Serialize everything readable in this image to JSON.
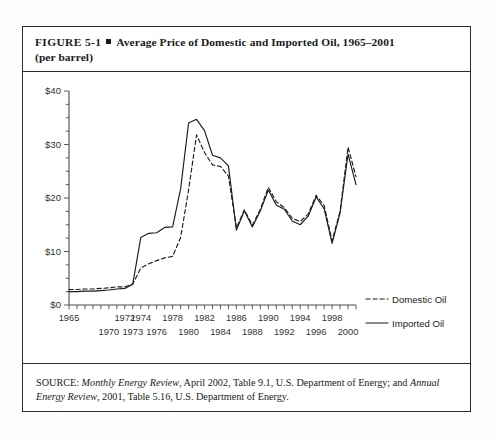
{
  "figure": {
    "number": "FIGURE  5-1",
    "bullet": "square-bullet",
    "title_line1": "Average Price of Domestic and Imported Oil, 1965–2001",
    "title_line2": "(per barrel)"
  },
  "source": {
    "label": "SOURCE:",
    "part1_italic": "Monthly Energy Review",
    "part2": ", April 2002, Table 9.1, U.S. Department of Energy; and ",
    "part3_italic": "Annual Energy Review",
    "part4": ", 2001, Table 5.16, U.S. Department of Energy."
  },
  "legend": {
    "domestic_label": "Domestic Oil",
    "imported_label": "Imported Oil"
  },
  "chart_data": {
    "type": "line",
    "title": "Average Price of Domestic and Imported Oil, 1965–2001 (per barrel)",
    "xlabel": "",
    "ylabel": "",
    "xlim": [
      1965,
      2001
    ],
    "ylim": [
      0,
      40
    ],
    "grid": false,
    "legend_position": "bottom-right",
    "y_tick_labels": [
      "$0",
      "$10",
      "$20",
      "$30",
      "$40"
    ],
    "y_tick_values": [
      0,
      10,
      20,
      30,
      40
    ],
    "y_minor_tick_step": 2.5,
    "x_tick_labels_upper": [
      "1965",
      "1972",
      "1974",
      "1978",
      "1982",
      "1986",
      "1990",
      "1994",
      "1998"
    ],
    "x_tick_values_upper": [
      1965,
      1972,
      1974,
      1978,
      1982,
      1986,
      1990,
      1994,
      1998
    ],
    "x_tick_labels_lower": [
      "1970",
      "1973",
      "1976",
      "1980",
      "1984",
      "1988",
      "1992",
      "1996",
      "2000"
    ],
    "x_tick_values_lower": [
      1970,
      1973,
      1976,
      1980,
      1984,
      1988,
      1992,
      1996,
      2000
    ],
    "x_minor_tick_step": 1,
    "x": [
      1965,
      1966,
      1967,
      1968,
      1969,
      1970,
      1971,
      1972,
      1973,
      1974,
      1975,
      1976,
      1977,
      1978,
      1979,
      1980,
      1981,
      1982,
      1983,
      1984,
      1985,
      1986,
      1987,
      1988,
      1989,
      1990,
      1991,
      1992,
      1993,
      1994,
      1995,
      1996,
      1997,
      1998,
      1999,
      2000,
      2001
    ],
    "series": [
      {
        "name": "Domestic Oil",
        "style": "dashed",
        "values": [
          2.9,
          2.9,
          3.0,
          3.0,
          3.1,
          3.2,
          3.4,
          3.4,
          3.9,
          6.9,
          7.7,
          8.3,
          8.8,
          9.1,
          12.6,
          21.5,
          31.8,
          28.5,
          26.2,
          25.9,
          24.1,
          14.4,
          17.8,
          14.9,
          17.9,
          22.0,
          19.3,
          18.2,
          16.2,
          15.6,
          17.0,
          20.5,
          18.6,
          12.0,
          17.5,
          29.5,
          24.0
        ]
      },
      {
        "name": "Imported Oil",
        "style": "solid",
        "values": [
          2.5,
          2.5,
          2.6,
          2.6,
          2.7,
          2.8,
          3.0,
          3.1,
          3.9,
          12.6,
          13.4,
          13.5,
          14.5,
          14.6,
          21.7,
          34.0,
          34.7,
          32.6,
          28.0,
          27.5,
          26.0,
          14.0,
          17.6,
          14.6,
          17.6,
          21.5,
          18.7,
          17.9,
          15.7,
          15.0,
          16.6,
          20.2,
          18.0,
          11.5,
          17.2,
          28.2,
          22.5
        ]
      }
    ]
  }
}
